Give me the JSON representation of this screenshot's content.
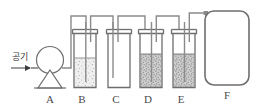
{
  "diagram": {
    "kind": "science-apparatus-diagram",
    "canvas": {
      "width": 257,
      "height": 109,
      "background": "#ffffff"
    },
    "colors": {
      "outline": "#6e6e6e",
      "outline_dark": "#555555",
      "tube": "#8a8a8a",
      "label": "#4a4a4a",
      "liquid_light": "#efefef",
      "liquid_light_speck": "#9a9a9a",
      "liquid_dark": "#cfcfcf",
      "liquid_dark_speck": "#6f6f6f",
      "vessel_fill": "#ffffff"
    },
    "inlet": {
      "label": "공기",
      "label_meaning": "air",
      "arrow_direction": "right",
      "arrow_glyph": "→"
    },
    "components": [
      {
        "id": "A",
        "label": "A",
        "type": "air-pump",
        "shape": "circle-on-trapezoid-base",
        "liquid": "none",
        "liquid_level_pct": 0
      },
      {
        "id": "B",
        "label": "B",
        "type": "gas-washing-bottle",
        "shape": "cylinder-with-rim",
        "liquid": "light-stipple",
        "liquid_level_pct": 58
      },
      {
        "id": "C",
        "label": "C",
        "type": "gas-washing-bottle",
        "shape": "cylinder-with-rim",
        "liquid": "none",
        "liquid_level_pct": 0
      },
      {
        "id": "D",
        "label": "D",
        "type": "gas-washing-bottle",
        "shape": "cylinder-with-rim",
        "liquid": "dark-stipple",
        "liquid_level_pct": 68
      },
      {
        "id": "E",
        "label": "E",
        "type": "gas-washing-bottle",
        "shape": "cylinder-with-rim",
        "liquid": "dark-stipple",
        "liquid_level_pct": 68
      },
      {
        "id": "F",
        "label": "F",
        "type": "collection-vessel",
        "shape": "rounded-rectangle",
        "liquid": "none",
        "liquid_level_pct": 0
      }
    ],
    "connections": [
      {
        "from": "A",
        "to": "B",
        "style": "tube-up-over-down"
      },
      {
        "from": "B",
        "to": "C",
        "style": "tube-up-over-down"
      },
      {
        "from": "C",
        "to": "D",
        "style": "tube-up-over-down"
      },
      {
        "from": "D",
        "to": "E",
        "style": "tube-up-over-down"
      },
      {
        "from": "E",
        "to": "F",
        "style": "tube-up-over-down"
      }
    ]
  }
}
